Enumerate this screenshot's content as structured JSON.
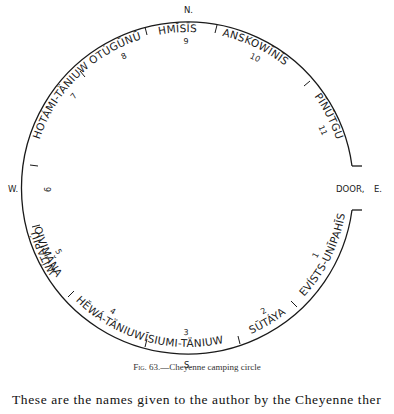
{
  "figure": {
    "caption_prefix": "Fig. 63.",
    "caption_text": "—Cheyenne camping circle",
    "compass": {
      "north": "N.",
      "south": "S.",
      "west": "W.",
      "east": "E.",
      "door": "DOOR,"
    },
    "bands": [
      {
        "number": "1",
        "name": "EVĺSTS-UNĪPAHĪS"
      },
      {
        "number": "2",
        "name": "SŪTÁYA"
      },
      {
        "number": "3",
        "name": "ĪSIUMI-TÄNIUW"
      },
      {
        "number": "4",
        "name": "HĔWÁ-TÄNIUW"
      },
      {
        "number": "5",
        "name": "OIVIMĂNA"
      },
      {
        "number": "6",
        "name": "WĺTAPIÚ"
      },
      {
        "number": "7",
        "name": "HOTÁMI-TÄNIUW"
      },
      {
        "number": "8",
        "name": "OTÚGŪNŪ"
      },
      {
        "number": "9",
        "name": "HMĬSĪS"
      },
      {
        "number": "10",
        "name": "ANSKOWĪNĪS"
      },
      {
        "number": "11",
        "name": "PĪNŪTGU"
      }
    ]
  },
  "body_text": "These are the names given to the author by the Cheyenne ther"
}
